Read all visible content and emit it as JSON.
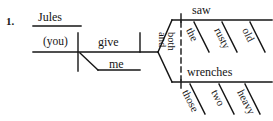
{
  "exercise": {
    "number": "1."
  },
  "diagram": {
    "type": "reed-kellogg-sentence-diagram",
    "ink_color": "#151515",
    "background_color": "#ffffff",
    "subject": "(you)",
    "verb": "give",
    "vocative": "Jules",
    "indirect_object": "me",
    "compound_direct_object": {
      "correlative_conjunction_upper": "both",
      "correlative_conjunction_lower": "and",
      "branches": [
        {
          "head": "saw",
          "modifiers": [
            "the",
            "rusty",
            "old"
          ]
        },
        {
          "head": "wrenches",
          "modifiers": [
            "those",
            "two",
            "heavy"
          ]
        }
      ]
    }
  }
}
